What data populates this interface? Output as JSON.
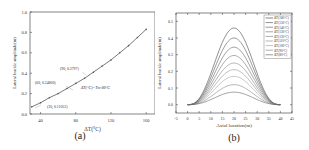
{
  "chart_data": [
    {
      "type": "line",
      "panel_label": "(a)",
      "title": "",
      "xlabel": "ΔT(°C)",
      "ylabel": "Lateral buckle amplitude(m)",
      "xlim": [
        28,
        170
      ],
      "ylim": [
        0.0,
        1.0
      ],
      "xticks": [
        40,
        80,
        120,
        160
      ],
      "yticks": [
        "0.0",
        "0.2",
        "0.4",
        "0.6",
        "0.8",
        "1.0"
      ],
      "grid": false,
      "x": [
        30,
        40,
        50,
        60,
        70,
        80,
        90,
        100,
        110,
        120,
        130,
        140,
        150,
        160
      ],
      "series": [
        {
          "name": "Lateral buckle amplitude",
          "values": [
            0.07,
            0.11,
            0.16,
            0.2,
            0.25,
            0.3,
            0.35,
            0.41,
            0.47,
            0.53,
            0.6,
            0.67,
            0.75,
            0.83
          ]
        }
      ],
      "annotations": [
        {
          "text": "(30, 0.11052)",
          "x": 30,
          "y": 0.07
        },
        {
          "text": "(60, 0.24860)",
          "x": 60,
          "y": 0.2
        },
        {
          "text": "(90, 0.3797)",
          "x": 90,
          "y": 0.35
        },
        {
          "text": "ΔT(°C)=Tm-80°C",
          "x": 105,
          "y": 0.28
        }
      ]
    },
    {
      "type": "line",
      "panel_label": "(b)",
      "title": "",
      "xlabel": "Axial location(m)",
      "ylabel": "Lateral buckle amplitude(m)",
      "xlim": [
        -5,
        45
      ],
      "ylim": [
        -0.05,
        0.55
      ],
      "xticks": [
        -5,
        0,
        5,
        10,
        15,
        20,
        25,
        30,
        35,
        40,
        45
      ],
      "yticks": [
        "0.0",
        "0.1",
        "0.2",
        "0.3",
        "0.4",
        "0.5"
      ],
      "grid": false,
      "legend_position": "upper right",
      "x_peak": 20,
      "x_start": 0,
      "x_end": 40,
      "series": [
        {
          "name": "ΔT(160°C)",
          "peak": 0.46
        },
        {
          "name": "ΔT(150°C)",
          "peak": 0.4
        },
        {
          "name": "ΔT(140°C)",
          "peak": 0.345
        },
        {
          "name": "ΔT(130°C)",
          "peak": 0.295
        },
        {
          "name": "ΔT(120°C)",
          "peak": 0.25
        },
        {
          "name": "ΔT(110°C)",
          "peak": 0.21
        },
        {
          "name": "ΔT(100°C)",
          "peak": 0.17
        },
        {
          "name": "ΔT(90°C)",
          "peak": 0.12
        },
        {
          "name": "ΔT(80°C)",
          "peak": 0.075
        }
      ]
    }
  ],
  "captions": {
    "a": "(a)",
    "b": "(b)"
  },
  "colors": {
    "line": "#555555",
    "axis": "#333333",
    "text": "#333333"
  }
}
